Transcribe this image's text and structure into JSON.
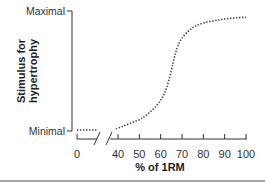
{
  "chart_data": {
    "type": "line",
    "title": "",
    "xlabel": "% of 1RM",
    "ylabel": "Stimulus for hypertrophy",
    "ylabel_lines": [
      "Stimulus for",
      "hypertrophy"
    ],
    "y_level_labels": {
      "top": "Maximal",
      "bottom": "Minimal"
    },
    "x_ticks": [
      0,
      40,
      50,
      60,
      70,
      80,
      90,
      100
    ],
    "x_tick_labels": [
      "0",
      "40",
      "50",
      "60",
      "70",
      "80",
      "90",
      "100"
    ],
    "x_axis_break": {
      "from": 0,
      "to": 40
    },
    "xlim": [
      0,
      100
    ],
    "ylim": [
      0,
      1
    ],
    "grid": false,
    "legend": "none",
    "series": [
      {
        "name": "minimal-segment",
        "style": "dotted",
        "x": [
          0,
          19
        ],
        "y": [
          0.0,
          0.0
        ]
      },
      {
        "name": "stimulus-curve",
        "style": "dotted",
        "x": [
          38,
          42,
          46,
          50,
          54,
          58,
          61,
          63,
          65,
          66,
          67,
          68,
          70,
          73,
          76,
          80,
          85,
          90,
          95,
          100
        ],
        "y": [
          0.01,
          0.03,
          0.06,
          0.09,
          0.14,
          0.21,
          0.29,
          0.38,
          0.52,
          0.6,
          0.67,
          0.73,
          0.8,
          0.86,
          0.9,
          0.93,
          0.95,
          0.965,
          0.975,
          0.98
        ]
      }
    ]
  }
}
